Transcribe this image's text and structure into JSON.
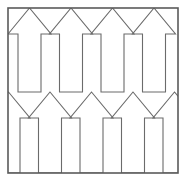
{
  "figure": {
    "kind": "line-drawing",
    "background_color": "#ffffff",
    "line_color": "#6b6b6b",
    "frame_color": "#5a5a5a",
    "artifact_color": "#3a3a3a",
    "line_width": 1.1,
    "frame_line_width": 1.6,
    "canvas": {
      "width": 187,
      "height": 181
    },
    "frame": {
      "left": 8,
      "top": 8,
      "right": 178,
      "bottom": 173,
      "width": 170,
      "height": 165
    },
    "rows": [
      {
        "name": "upper-arrow-row",
        "tip_y": 8,
        "head_base_y": 34,
        "shaft_top_y": 34,
        "shaft_bottom_y": 92,
        "count": 4,
        "tip_x": [
          29.5,
          71.0,
          112.5,
          154.0
        ],
        "shaft_half_width": 11.5,
        "head_half_width": 21.5
      },
      {
        "name": "lower-arrow-row",
        "tip_y": 92,
        "head_base_y": 118,
        "shaft_top_y": 118,
        "shaft_bottom_y": 173,
        "count": 5,
        "tip_x": [
          8.5,
          50.0,
          91.5,
          133.0,
          174.5
        ],
        "shaft_half_width": 11.5,
        "head_half_width": 21.5
      }
    ],
    "period": 41.5,
    "edge_artifact": {
      "name": "cropped-glyph-fragment",
      "x": 0,
      "y": 7,
      "width": 2,
      "height": 13
    }
  }
}
